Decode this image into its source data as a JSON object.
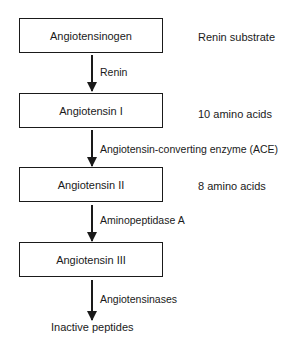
{
  "diagram": {
    "nodes": [
      {
        "label": "Angiotensinogen",
        "annotation": "Renin substrate"
      },
      {
        "label": "Angiotensin I",
        "annotation": "10 amino acids"
      },
      {
        "label": "Angiotensin II",
        "annotation": "8 amino acids"
      },
      {
        "label": "Angiotensin III",
        "annotation": ""
      }
    ],
    "edges": [
      {
        "from": "Angiotensinogen",
        "to": "Angiotensin I",
        "label": "Renin"
      },
      {
        "from": "Angiotensin I",
        "to": "Angiotensin II",
        "label": "Angiotensin-converting enzyme (ACE)"
      },
      {
        "from": "Angiotensin II",
        "to": "Angiotensin III",
        "label": "Aminopeptidase A"
      },
      {
        "from": "Angiotensin III",
        "to": "Inactive peptides",
        "label": "Angiotensinases"
      }
    ],
    "terminal": "Inactive peptides"
  }
}
